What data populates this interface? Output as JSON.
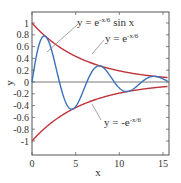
{
  "chart_data": {
    "type": "line",
    "title": "",
    "xlabel": "x",
    "ylabel": "y",
    "xlim": [
      0,
      15.5
    ],
    "ylim": [
      -1.2,
      1.1
    ],
    "x_ticks": [
      0,
      5,
      10,
      15
    ],
    "x_tick_labels": [
      "0",
      "5",
      "10",
      "15"
    ],
    "y_ticks": [
      1,
      0.8,
      0.6,
      0.4,
      0.2,
      0,
      -0.2,
      -0.4,
      -0.6,
      -0.8,
      -1
    ],
    "y_tick_labels": [
      "1",
      "0.8",
      "0.6",
      "0.4",
      "0.2",
      "0",
      "-0.2",
      "-0.4",
      "-0.6",
      "-0.8",
      "-1"
    ],
    "grid": false,
    "series": [
      {
        "name": "y = e^(-x/6) sin x",
        "color": "#3a72b8",
        "formula": "exp(-x/6)*sin(x)",
        "x": [
          0,
          1.57,
          3.14,
          4.71,
          6.28,
          7.85,
          9.42,
          11.0,
          12.57,
          14.14,
          15.5
        ],
        "values": [
          0,
          0.77,
          0,
          -0.46,
          0,
          0.27,
          0,
          -0.16,
          0,
          0.09,
          0.07
        ]
      },
      {
        "name": "y = e^(-x/6)",
        "color": "#c0343c",
        "formula": "exp(-x/6)",
        "x": [
          0,
          2,
          4,
          6,
          8,
          10,
          12,
          14,
          15.5
        ],
        "values": [
          1,
          0.72,
          0.51,
          0.37,
          0.26,
          0.19,
          0.14,
          0.1,
          0.08
        ]
      },
      {
        "name": "y = -e^(-x/6)",
        "color": "#c0343c",
        "formula": "-exp(-x/6)",
        "x": [
          0,
          2,
          4,
          6,
          8,
          10,
          12,
          14,
          15.5
        ],
        "values": [
          -1,
          -0.72,
          -0.51,
          -0.37,
          -0.26,
          -0.19,
          -0.14,
          -0.1,
          -0.08
        ]
      }
    ],
    "annotations": [
      {
        "text_main": "y = e",
        "sup": "-x/6",
        "text_after": " sin x"
      },
      {
        "text_main": "y = e",
        "sup": "-x/6",
        "text_after": ""
      },
      {
        "text_main": "y = -e",
        "sup": "-x/6",
        "text_after": ""
      }
    ]
  }
}
